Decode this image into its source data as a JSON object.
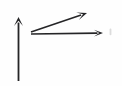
{
  "canvas": {
    "width": 122,
    "height": 86,
    "background_color": "#fefefe",
    "ink_color": "#252527",
    "smudge_color": "#dcdcdc",
    "title": "Hand-drawn arrow diagram"
  },
  "chart_data": {
    "type": "diagram",
    "title": "",
    "xlabel": "",
    "ylabel": "",
    "legend": [],
    "annotations": [],
    "elements": [
      {
        "name": "vertical-axis-arrow",
        "kind": "arrow",
        "direction": "up",
        "from": [
          18.5,
          81
        ],
        "to": [
          18.5,
          17
        ],
        "stroke_width": 1.8,
        "head_length": 9,
        "head_width": 9
      },
      {
        "name": "diagonal-arrow",
        "kind": "arrow",
        "direction": "up-right",
        "from": [
          31,
          32
        ],
        "to": [
          87,
          13
        ],
        "stroke_width": 1.6,
        "head_length": 10,
        "head_width": 8
      },
      {
        "name": "horizontal-arrow",
        "kind": "arrow",
        "direction": "right",
        "from": [
          31,
          34
        ],
        "to": [
          103,
          33
        ],
        "stroke_width": 1.6,
        "head_length": 9,
        "head_width": 7
      },
      {
        "name": "faint-speck",
        "kind": "speck",
        "at": [
          110.5,
          32
        ],
        "width": 2,
        "height": 7
      }
    ]
  }
}
